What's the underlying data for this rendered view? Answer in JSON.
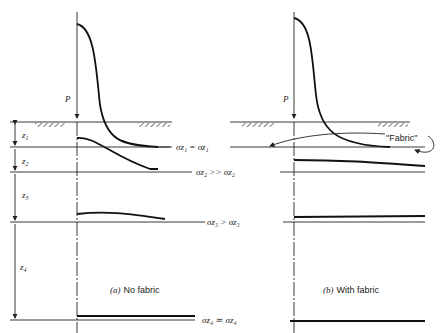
{
  "figure": {
    "load_label": "P",
    "panels": [
      {
        "id": "a",
        "caption_prefix": "(a)",
        "caption_text": "No fabric",
        "layers": [
          {
            "label": "z",
            "sub": "1",
            "relation": "σz₁ = σz₁"
          },
          {
            "label": "z",
            "sub": "2",
            "relation": "σz₂ >> σz₂"
          },
          {
            "label": "z",
            "sub": "3",
            "relation": "σz₃ > σz₃"
          },
          {
            "label": "z",
            "sub": "4",
            "relation": "σz₄ ≃ σz₄"
          }
        ]
      },
      {
        "id": "b",
        "caption_prefix": "(b)",
        "caption_text": "With fabric",
        "fabric_label": "\"Fabric\""
      }
    ]
  }
}
